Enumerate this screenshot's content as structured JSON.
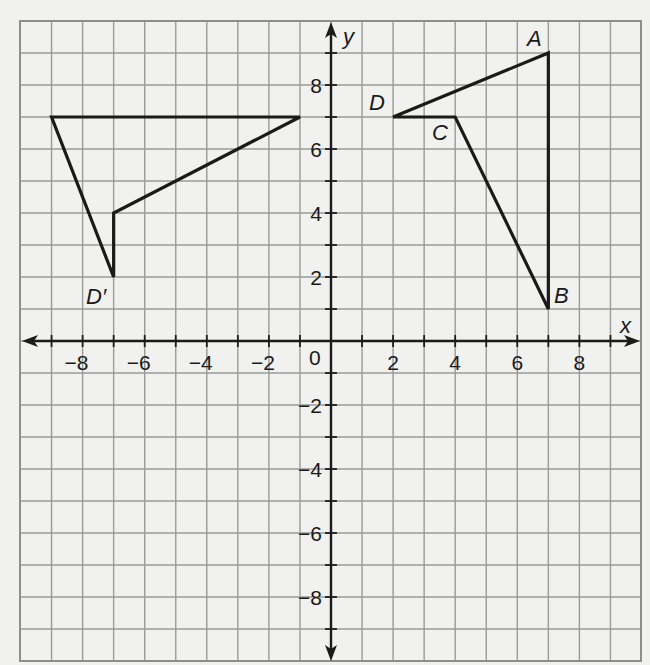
{
  "chart_data": {
    "type": "scatter",
    "title": "",
    "xlabel": "x",
    "ylabel": "y",
    "xlim": [
      -10,
      10
    ],
    "ylim": [
      -10,
      10
    ],
    "grid": true,
    "grid_step": 1,
    "x_tick_labels": [
      "-8",
      "-6",
      "-4",
      "-2",
      "2",
      "4",
      "6",
      "8"
    ],
    "x_ticks": [
      -8,
      -6,
      -4,
      -2,
      2,
      4,
      6,
      8
    ],
    "y_tick_labels": [
      "8",
      "6",
      "4",
      "2",
      "-2",
      "-4",
      "-6",
      "-8"
    ],
    "y_ticks": [
      8,
      6,
      4,
      2,
      -2,
      -4,
      -6,
      -8
    ],
    "origin_label": "0",
    "series": [
      {
        "name": "ABCD",
        "closed": true,
        "points": [
          {
            "label": "A",
            "x": 7,
            "y": 9
          },
          {
            "label": "B",
            "x": 7,
            "y": 1
          },
          {
            "label": "C",
            "x": 4,
            "y": 7
          },
          {
            "label": "D",
            "x": 2,
            "y": 7
          }
        ]
      },
      {
        "name": "A'B'C'D'",
        "closed": true,
        "points": [
          {
            "label": "",
            "x": -1,
            "y": 7
          },
          {
            "label": "",
            "x": -9,
            "y": 7
          },
          {
            "label": "D'",
            "x": -7,
            "y": 2
          },
          {
            "label": "",
            "x": -7,
            "y": 4
          }
        ]
      }
    ]
  },
  "labels": {
    "x_axis": "x",
    "y_axis": "y",
    "origin": "0",
    "A": "A",
    "B": "B",
    "C": "C",
    "D": "D",
    "D_prime": "D′"
  }
}
